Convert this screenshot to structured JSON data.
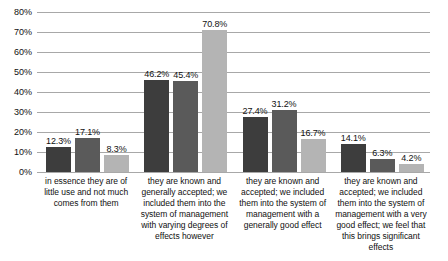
{
  "chart_data": {
    "type": "bar",
    "title": "",
    "subtitle": "",
    "xlabel": "",
    "ylabel": "",
    "ylim": [
      0,
      80
    ],
    "ytick_step": 10,
    "ytick_labels": [
      "0%",
      "10%",
      "20%",
      "30%",
      "40%",
      "50%",
      "60%",
      "70%",
      "80%"
    ],
    "grid": "horizontal",
    "legend": "none",
    "value_suffix": "%",
    "categories": [
      "in essence they are of little use and not much comes from them",
      "they are known and generally accepted; we included them into the system of management with varying degrees of effects however",
      "they are known and accepted; we included them into the system of management with a generally good effect",
      "they are known and accepted; we included them into the system of management with a very good effect; we feel that this brings significant effects"
    ],
    "series": [
      {
        "name": "series-1",
        "color": "#3d3d3d",
        "values": [
          12.3,
          17.1,
          27.4,
          14.1
        ],
        "labels": [
          "12.3%",
          "17.1%",
          "27.4%",
          "14.1%"
        ]
      },
      {
        "name": "series-2",
        "color": "#5a5a5a",
        "values": [
          17.1,
          45.4,
          31.2,
          6.3
        ],
        "labels": [
          "17.1%",
          "45.4%",
          "31.2%",
          "6.3%"
        ]
      },
      {
        "name": "series-3",
        "color": "#b4b4b4",
        "values": [
          8.3,
          70.8,
          16.7,
          4.2
        ],
        "labels": [
          "8.3%",
          "70.8%",
          "16.7%",
          "4.2%"
        ]
      }
    ],
    "groups": [
      {
        "category_index": 0,
        "bars": [
          {
            "series": 0,
            "value": 12.3,
            "label": "12.3%",
            "color": "#3d3d3d"
          },
          {
            "series": 1,
            "value": 17.1,
            "label": "17.1%",
            "color": "#5a5a5a"
          },
          {
            "series": 2,
            "value": 8.3,
            "label": "8.3%",
            "color": "#b4b4b4"
          }
        ]
      },
      {
        "category_index": 1,
        "bars": [
          {
            "series": 0,
            "value": 46.2,
            "label": "46.2%",
            "color": "#3d3d3d"
          },
          {
            "series": 1,
            "value": 45.4,
            "label": "45.4%",
            "color": "#5a5a5a"
          },
          {
            "series": 2,
            "value": 70.8,
            "label": "70.8%",
            "color": "#b4b4b4"
          }
        ]
      },
      {
        "category_index": 2,
        "bars": [
          {
            "series": 0,
            "value": 27.4,
            "label": "27.4%",
            "color": "#3d3d3d"
          },
          {
            "series": 1,
            "value": 31.2,
            "label": "31.2%",
            "color": "#5a5a5a"
          },
          {
            "series": 2,
            "value": 16.7,
            "label": "16.7%",
            "color": "#b4b4b4"
          }
        ]
      },
      {
        "category_index": 3,
        "bars": [
          {
            "series": 0,
            "value": 14.1,
            "label": "14.1%",
            "color": "#3d3d3d"
          },
          {
            "series": 1,
            "value": 6.3,
            "label": "6.3%",
            "color": "#5a5a5a"
          },
          {
            "series": 2,
            "value": 4.2,
            "label": "4.2%",
            "color": "#b4b4b4"
          }
        ]
      }
    ],
    "colors": {
      "gridline": "#a8a8a8",
      "text": "#111111",
      "background": "#ffffff"
    }
  }
}
